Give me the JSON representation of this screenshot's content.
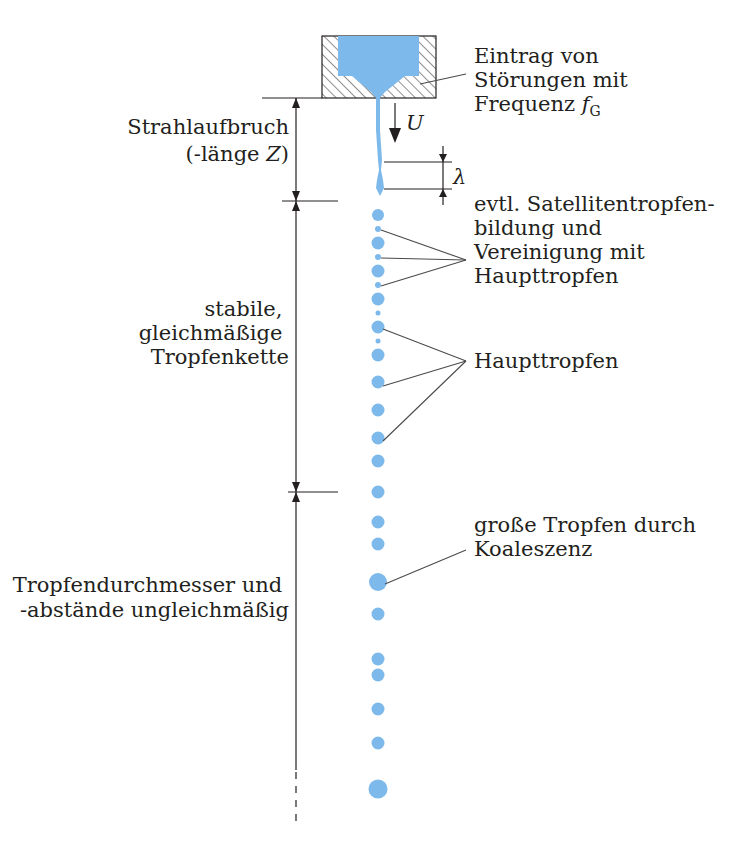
{
  "colors": {
    "liquid": "#7db9ea",
    "ink": "#231f20",
    "leader": "#4a4a4a",
    "background": "#ffffff"
  },
  "labels": {
    "disturbance": [
      "Eintrag von",
      "Störungen mit",
      "Frequenz "
    ],
    "disturbance_symbol": "f",
    "disturbance_subscript": "G",
    "velocity_symbol": "U",
    "wavelength_symbol": "λ",
    "breakup": [
      "Strahlaufbruch",
      "(-länge "
    ],
    "breakup_symbol": "Z",
    "breakup_close": ")",
    "satellite": [
      "evtl. Satellitentropfen-",
      "bildung und",
      "Vereinigung mit",
      "Haupttropfen"
    ],
    "stable_chain": [
      "stabile,",
      "gleichmäßige",
      "Tropfenkette"
    ],
    "main_drops": "Haupttropfen",
    "coalescence": [
      "große Tropfen durch",
      "Koaleszenz"
    ],
    "irregular": [
      "Tropfendurchmesser und",
      "-abstände ungleichmäßig"
    ]
  },
  "drops": [
    {
      "y": 215,
      "r": 6
    },
    {
      "y": 229,
      "r": 3
    },
    {
      "y": 243,
      "r": 6.5
    },
    {
      "y": 257,
      "r": 3
    },
    {
      "y": 271,
      "r": 6.5
    },
    {
      "y": 285,
      "r": 3
    },
    {
      "y": 299,
      "r": 6.5
    },
    {
      "y": 313,
      "r": 2.5
    },
    {
      "y": 327,
      "r": 6.5
    },
    {
      "y": 341,
      "r": 2.5
    },
    {
      "y": 355,
      "r": 6.5
    },
    {
      "y": 382,
      "r": 6.5
    },
    {
      "y": 410,
      "r": 6.5
    },
    {
      "y": 438,
      "r": 6.5
    },
    {
      "y": 461,
      "r": 6.5
    },
    {
      "y": 492,
      "r": 6.5
    },
    {
      "y": 522,
      "r": 6.5
    },
    {
      "y": 544,
      "r": 6.5
    },
    {
      "y": 582,
      "r": 9
    },
    {
      "y": 614,
      "r": 6.5
    },
    {
      "y": 659,
      "r": 6.5
    },
    {
      "y": 675,
      "r": 6.5
    },
    {
      "y": 709,
      "r": 6.5
    },
    {
      "y": 743,
      "r": 6.5
    },
    {
      "y": 789,
      "r": 9.5
    }
  ]
}
